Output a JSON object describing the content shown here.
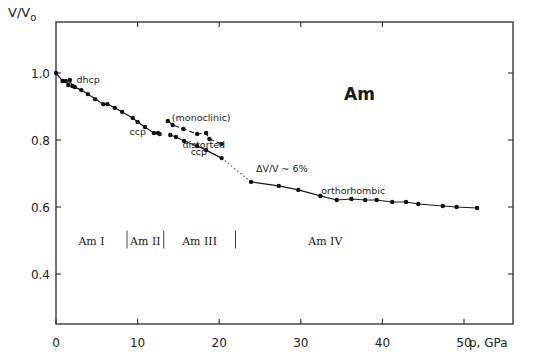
{
  "chart_data": {
    "type": "scatter",
    "title": "Am",
    "xlabel": "p, GPa",
    "ylabel": "V/V₀",
    "xlim": [
      0,
      56
    ],
    "ylim": [
      0.25,
      1.15
    ],
    "xticks": [
      0,
      10,
      20,
      30,
      40,
      50
    ],
    "xtick_labels": [
      "0",
      "10",
      "20",
      "30",
      "40",
      "50"
    ],
    "yticks": [
      1.0,
      0.8,
      0.6,
      0.4
    ],
    "ytick_labels": [
      "1.0",
      "0.8",
      "0.6",
      "0.4"
    ],
    "grid": false,
    "series": [
      {
        "name": "dhcp / ccp",
        "line": "solid-dashed",
        "x": [
          0,
          0.8,
          1.2,
          1.5,
          1.7,
          2.0,
          2.3,
          3.1,
          3.9,
          4.8,
          5.8,
          6.3,
          7.2,
          8.1,
          9.4,
          10.0,
          10.9,
          12.0,
          12.5,
          12.7
        ],
        "y": [
          1.0,
          0.976,
          0.976,
          0.964,
          0.979,
          0.961,
          0.958,
          0.949,
          0.937,
          0.922,
          0.907,
          0.907,
          0.896,
          0.884,
          0.866,
          0.854,
          0.839,
          0.821,
          0.821,
          0.818
        ]
      },
      {
        "name": "monoclinic",
        "line": "dashed",
        "x": [
          13.7,
          14.3,
          15.6,
          17.3,
          18.4,
          18.8,
          20.3
        ],
        "y": [
          0.857,
          0.845,
          0.833,
          0.818,
          0.821,
          0.803,
          0.788
        ]
      },
      {
        "name": "distorted ccp",
        "line": "solid",
        "x": [
          14.0,
          14.7,
          15.7,
          17.3,
          18.4,
          20.3
        ],
        "y": [
          0.815,
          0.809,
          0.797,
          0.782,
          0.77,
          0.746
        ]
      },
      {
        "name": "orthorhombic",
        "line": "solid",
        "x": [
          23.9,
          27.3,
          29.7,
          32.4,
          34.4,
          36.2,
          37.9,
          39.3,
          41.2,
          42.9,
          44.4,
          47.4,
          49.1,
          51.6
        ],
        "y": [
          0.675,
          0.663,
          0.651,
          0.633,
          0.621,
          0.624,
          0.621,
          0.621,
          0.615,
          0.615,
          0.609,
          0.603,
          0.6,
          0.597
        ]
      }
    ],
    "transition_line": {
      "style": "dotted",
      "from": [
        20.3,
        0.746
      ],
      "to": [
        23.9,
        0.675
      ]
    },
    "annotations": [
      {
        "text": "dhcp",
        "x": 2.5,
        "y": 0.97
      },
      {
        "text": "ccp",
        "x": 9.0,
        "y": 0.815
      },
      {
        "text": "(monoclinic)",
        "x": 14.2,
        "y": 0.858
      },
      {
        "text": "distorted",
        "x": 15.5,
        "y": 0.775
      },
      {
        "text": "ccp",
        "x": 16.5,
        "y": 0.755
      },
      {
        "text": "ΔV/V ~ 6%",
        "x": 24.5,
        "y": 0.705
      },
      {
        "text": "orthorhombic",
        "x": 32.5,
        "y": 0.64
      }
    ],
    "phase_regions": [
      {
        "label": "Am I",
        "from": 0,
        "to": 8.7
      },
      {
        "label": "Am II",
        "from": 8.7,
        "to": 13.2
      },
      {
        "label": "Am III",
        "from": 13.2,
        "to": 22.0
      },
      {
        "label": "Am IV",
        "from": 22.0,
        "to": 56
      }
    ],
    "phase_separators_x": [
      8.7,
      13.2,
      22.0
    ],
    "phase_label_y": 0.5
  }
}
